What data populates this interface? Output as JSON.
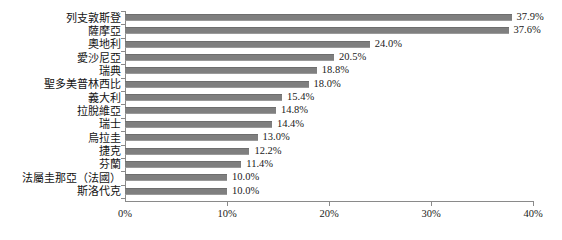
{
  "chart_data": {
    "type": "bar",
    "orientation": "horizontal",
    "title": "",
    "xlabel": "",
    "ylabel": "",
    "xlim": [
      0,
      40
    ],
    "xticks": [
      0,
      10,
      20,
      30,
      40
    ],
    "xtick_labels": [
      "0%",
      "10%",
      "20%",
      "30%",
      "40%"
    ],
    "grid": false,
    "legend": null,
    "bar_color": "#7f7f7f",
    "axis_color": "#8a8a8a",
    "value_label_suffix": "%",
    "categories": [
      "列支敦斯登",
      "薩摩亞",
      "奧地利",
      "愛沙尼亞",
      "瑞典",
      "聖多美普林西比",
      "義大利",
      "拉脫維亞",
      "瑞士",
      "烏拉圭",
      "捷克",
      "芬蘭",
      "法屬圭那亞（法國）",
      "斯洛代克"
    ],
    "values": [
      37.9,
      37.6,
      24.0,
      20.5,
      18.8,
      18.0,
      15.4,
      14.8,
      14.4,
      13.0,
      12.2,
      11.4,
      10.0,
      10.0
    ],
    "value_labels": [
      "37.9%",
      "37.6%",
      "24.0%",
      "20.5%",
      "18.8%",
      "18.0%",
      "15.4%",
      "14.8%",
      "14.4%",
      "13.0%",
      "12.2%",
      "11.4%",
      "10.0%",
      "10.0%"
    ]
  }
}
